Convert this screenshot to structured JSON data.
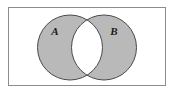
{
  "figure": {
    "name": "venn-diagram-symmetric-difference",
    "caption": "",
    "width": 174,
    "height": 93
  },
  "universe": {
    "label": "",
    "border_color": "#8c8c8c",
    "fill_color": "#ffffff",
    "x": 8,
    "y": 7,
    "width": 158,
    "height": 79,
    "stroke_width": 1
  },
  "sets": [
    {
      "id": "A",
      "label": "A",
      "cx": 70,
      "cy": 47.5,
      "r": 32.5,
      "fill_color": "#b9b9b9",
      "stroke_color": "#4a4a4a",
      "label_x": 55,
      "label_y": 32
    },
    {
      "id": "B",
      "label": "B",
      "cx": 104,
      "cy": 47.5,
      "r": 32.5,
      "fill_color": "#b9b9b9",
      "stroke_color": "#4a4a4a",
      "label_x": 114,
      "label_y": 32
    }
  ],
  "intersection": {
    "name": "A-intersect-B",
    "label": "",
    "fill_color": "#ffffff",
    "shaded": false
  },
  "shading": {
    "description": "symmetric difference",
    "shaded_regions": [
      "A-only",
      "B-only"
    ],
    "unshaded_regions": [
      "A-intersect-B",
      "outside-both"
    ],
    "shade_color": "#b9b9b9"
  }
}
